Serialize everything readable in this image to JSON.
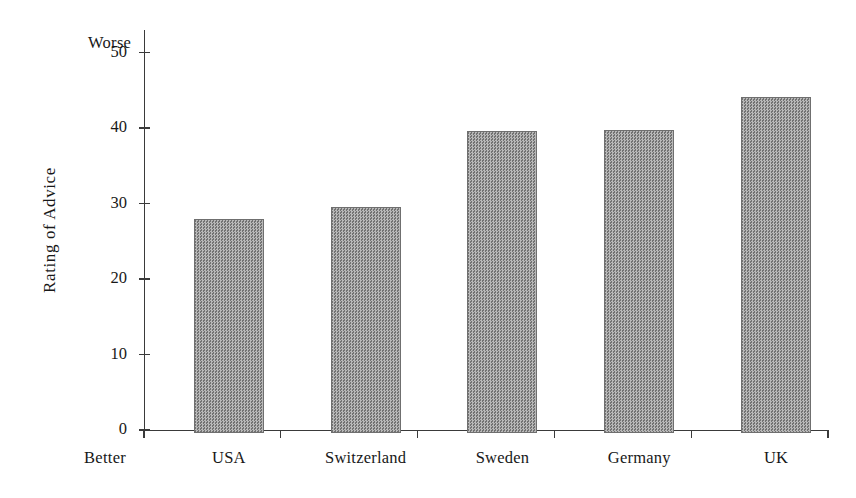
{
  "chart_data": {
    "type": "bar",
    "title": "",
    "subtitle": "",
    "xlabel": "",
    "ylabel": "Rating of Advice",
    "categories": [
      "USA",
      "Switzerland",
      "Sweden",
      "Germany",
      "UK"
    ],
    "values": [
      28.3,
      29.9,
      40.0,
      40.1,
      44.5
    ],
    "ylim": [
      0,
      53
    ],
    "yticks": [
      0,
      10,
      20,
      30,
      40,
      50
    ],
    "ytick_labels": [
      "0",
      "10",
      "20",
      "30",
      "40",
      "50"
    ],
    "grid": false,
    "legend": null,
    "annotations": [
      {
        "text": "Worse",
        "position": "top-of-y-axis",
        "meaning": "high values are worse"
      },
      {
        "text": "Better",
        "position": "bottom-of-y-axis",
        "meaning": "low values are better"
      }
    ],
    "bar_color": "#8f8f8f",
    "bar_edge_color": "#6f6f6f",
    "axis_color": "#3a3a3a",
    "background_color": "#ffffff"
  },
  "axis": {
    "y_label": "Rating of Advice",
    "anchor_high": "Worse",
    "anchor_low": "Better",
    "tick_labels": [
      "50",
      "40",
      "30",
      "20",
      "10",
      "0"
    ]
  },
  "bars": [
    {
      "label": "USA",
      "value": 28.3
    },
    {
      "label": "Switzerland",
      "value": 29.9
    },
    {
      "label": "Sweden",
      "value": 40.0
    },
    {
      "label": "Germany",
      "value": 40.1
    },
    {
      "label": "UK",
      "value": 44.5
    }
  ]
}
